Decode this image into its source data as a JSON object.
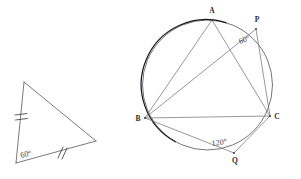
{
  "figure": {
    "background_color": "#ffffff",
    "line_color": "#5b5b62",
    "dark_arc_color": "#1d1d20",
    "label_color": "#2b2b2b",
    "width": 301,
    "height": 179
  },
  "triangle_figure": {
    "name": "isosceles-triangle",
    "vertices": {
      "top": {
        "x": 24,
        "y": 82
      },
      "bottom": {
        "x": 16,
        "y": 163
      },
      "right": {
        "x": 96,
        "y": 141
      }
    },
    "angle_label": "60",
    "angle_degree_symbol": "°",
    "angle_label_full": "60°",
    "tick_marks": [
      {
        "side": "left-side",
        "count": 2
      },
      {
        "side": "bottom-side",
        "count": 2
      }
    ]
  },
  "circle_figure": {
    "name": "cyclic-quadrilateral-in-circle",
    "circle": {
      "cx": 207.5,
      "cy": 85,
      "r": 65
    },
    "points": {
      "A": {
        "x": 212,
        "y": 20,
        "label": "A",
        "label_pos": "above"
      },
      "B": {
        "x": 145,
        "y": 118,
        "label": "B",
        "label_pos": "left"
      },
      "C": {
        "x": 270,
        "y": 116,
        "label": "C",
        "label_pos": "right"
      },
      "P": {
        "x": 256,
        "y": 29,
        "label": "P",
        "label_pos": "above"
      },
      "Q": {
        "x": 234,
        "y": 153,
        "label": "Q",
        "label_pos": "below"
      }
    },
    "segments": [
      {
        "from": "A",
        "to": "B"
      },
      {
        "from": "A",
        "to": "C"
      },
      {
        "from": "B",
        "to": "C"
      },
      {
        "from": "B",
        "to": "P"
      },
      {
        "from": "P",
        "to": "C"
      },
      {
        "from": "B",
        "to": "Q"
      },
      {
        "from": "Q",
        "to": "C"
      }
    ],
    "angles": [
      {
        "at": "P",
        "label": "60",
        "degree_symbol": "°",
        "label_full": "60°",
        "x": 247,
        "y": 45,
        "rotate": -22
      },
      {
        "at": "Q",
        "label": "120",
        "degree_symbol": "°",
        "label_full": "120°",
        "x": 218,
        "y": 145,
        "rotate": -8
      }
    ]
  }
}
